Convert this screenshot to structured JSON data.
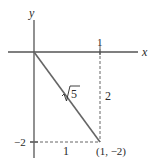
{
  "diagram": {
    "type": "coordinate-plane",
    "axes": {
      "x_label": "x",
      "y_label": "y"
    },
    "ticks": {
      "x_tick_label": "1",
      "y_tick_label": "−2"
    },
    "point": {
      "label": "(1, −2)",
      "x": 1,
      "y": -2
    },
    "segment": {
      "from": [
        0,
        0
      ],
      "to": [
        1,
        -2
      ],
      "length_label": "√5",
      "radical": "√",
      "radicand": "5"
    },
    "legs": {
      "vertical_label": "2",
      "horizontal_label": "1"
    },
    "colors": {
      "line": "#666666",
      "axis": "#555555",
      "text": "#2a2a2a",
      "background": "#ffffff"
    }
  }
}
